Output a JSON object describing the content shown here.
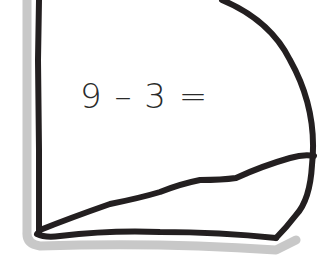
{
  "worksheet": {
    "equation": "9 – 3 =",
    "operand_a": "9",
    "operator": "–",
    "operand_b": "3",
    "equals": "="
  },
  "colors": {
    "stroke": "#231f20",
    "shadow": "#c8c8c8",
    "background": "#ffffff",
    "text": "#2a2a2a"
  }
}
